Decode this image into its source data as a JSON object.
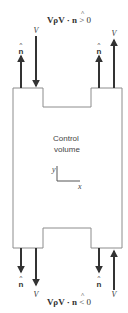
{
  "figure": {
    "top_condition": {
      "lhs": "VρV · ",
      "nhat": "n",
      "rhs": " > 0"
    },
    "bottom_condition": {
      "lhs": "VρV · ",
      "nhat": "n",
      "rhs": " < 0"
    },
    "control_volume_label": [
      "Control",
      "volume"
    ],
    "axes": {
      "x_label": "x",
      "y_label": "y"
    },
    "vector_labels": {
      "velocity": "V",
      "normal": "n"
    },
    "colors": {
      "stroke": "#333333",
      "outline": "#8c8c8c",
      "text": "#333333",
      "background": "#ffffff"
    }
  }
}
